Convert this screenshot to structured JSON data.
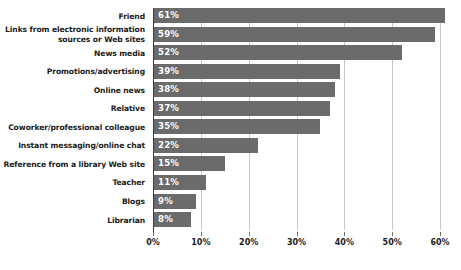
{
  "chart_data": {
    "type": "bar",
    "orientation": "horizontal",
    "title": "",
    "subtitle": "",
    "xlabel": "",
    "ylabel": "",
    "xlim": [
      0,
      60
    ],
    "grid": true,
    "legend": false,
    "value_suffix": "%",
    "bar_color": "#6b6b6b",
    "value_label_color": "#ffffff",
    "gridline_color": "#c8c8c8",
    "axis_color": "#3d3d3d",
    "xticks": [
      0,
      10,
      20,
      30,
      40,
      50,
      60
    ],
    "xtick_labels": [
      "0%",
      "10%",
      "20%",
      "30%",
      "40%",
      "50%",
      "60%"
    ],
    "categories": [
      "Friend",
      "Links from electronic information\nsources or Web sites",
      "News media",
      "Promotions/advertising",
      "Online news",
      "Relative",
      "Coworker/professional colleague",
      "Instant messaging/online chat",
      "Reference from a library Web site",
      "Teacher",
      "Blogs",
      "Librarian"
    ],
    "values": [
      61,
      59,
      52,
      39,
      38,
      37,
      35,
      22,
      15,
      11,
      9,
      8
    ],
    "data_labels": [
      "61%",
      "59%",
      "52%",
      "39%",
      "38%",
      "37%",
      "35%",
      "22%",
      "15%",
      "11%",
      "9%",
      "8%"
    ]
  }
}
